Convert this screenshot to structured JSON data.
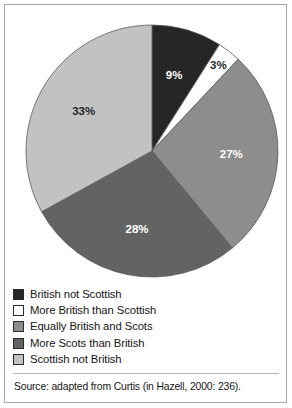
{
  "figure": {
    "source_note": "Source: adapted from Curtis (in Hazell, 2000: 236)."
  },
  "chart_data": {
    "type": "pie",
    "title": "",
    "categories": [
      "British not Scottish",
      "More British than Scottish",
      "Equally British and Scots",
      "More Scots than British",
      "Scottish not British"
    ],
    "values": [
      9,
      3,
      27,
      28,
      33
    ],
    "value_labels": [
      "9%",
      "3%",
      "27%",
      "28%",
      "33%"
    ],
    "colors": [
      "#262626",
      "#ffffff",
      "#8d8d8d",
      "#636363",
      "#c2c2c2"
    ],
    "label_text_colors": [
      "#ffffff",
      "#262626",
      "#ffffff",
      "#ffffff",
      "#262626"
    ],
    "start_angle_deg": 0,
    "direction": "clockwise",
    "legend_position": "bottom",
    "grid": false,
    "units": "percent"
  },
  "legend": {
    "items": [
      {
        "label": "British not Scottish",
        "swatch": "#262626"
      },
      {
        "label": "More British than Scottish",
        "swatch": "#ffffff"
      },
      {
        "label": "Equally British and Scots",
        "swatch": "#8d8d8d"
      },
      {
        "label": "More Scots than British",
        "swatch": "#636363"
      },
      {
        "label": "Scottish not British",
        "swatch": "#c2c2c2"
      }
    ]
  }
}
